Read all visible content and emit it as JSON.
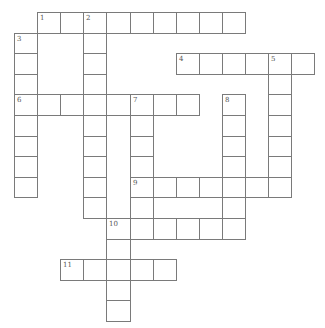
{
  "puzzle": {
    "cols": 13,
    "rows": 15,
    "origin_x": 14,
    "origin_y": 12,
    "cell_w": 23.1,
    "cell_h": 20.6,
    "line_color": "#7a7a7a",
    "number_color": "#555555",
    "entries": [
      {
        "number": "1",
        "direction": "across",
        "col": 1,
        "row": 0,
        "length": 9
      },
      {
        "number": "2",
        "direction": "down",
        "col": 3,
        "row": 0,
        "length": 10
      },
      {
        "number": "3",
        "direction": "down",
        "col": 0,
        "row": 1,
        "length": 8
      },
      {
        "number": "4",
        "direction": "across",
        "col": 7,
        "row": 2,
        "length": 6
      },
      {
        "number": "5",
        "direction": "down",
        "col": 11,
        "row": 2,
        "length": 7
      },
      {
        "number": "6",
        "direction": "across",
        "col": 0,
        "row": 4,
        "length": 8
      },
      {
        "number": "7",
        "direction": "down",
        "col": 5,
        "row": 4,
        "length": 7
      },
      {
        "number": "8",
        "direction": "down",
        "col": 9,
        "row": 4,
        "length": 7
      },
      {
        "number": "9",
        "direction": "across",
        "col": 5,
        "row": 8,
        "length": 7
      },
      {
        "number": "10",
        "direction": "across",
        "col": 4,
        "row": 10,
        "length": 6
      },
      {
        "number": "10",
        "direction": "down",
        "col": 4,
        "row": 10,
        "length": 5
      },
      {
        "number": "11",
        "direction": "across",
        "col": 2,
        "row": 12,
        "length": 5
      }
    ]
  }
}
